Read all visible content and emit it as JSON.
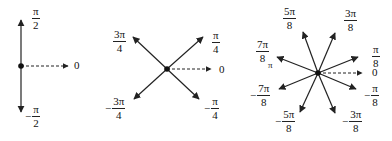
{
  "diagrams": [
    {
      "id": "two-directions",
      "center": [
        21,
        66
      ],
      "labels": {
        "up": {
          "sign": "",
          "num": "π",
          "den": "2"
        },
        "zero": "0",
        "down": {
          "sign": "−",
          "num": "π",
          "den": "2"
        }
      }
    },
    {
      "id": "four-directions",
      "center": [
        167,
        69
      ],
      "labels": {
        "ne": {
          "sign": "",
          "num": "π",
          "den": "4"
        },
        "nw": {
          "sign": "",
          "num": "3π",
          "den": "4"
        },
        "zero": "0",
        "sw": {
          "sign": "−",
          "num": "3π",
          "den": "4"
        },
        "se": {
          "sign": "−",
          "num": "π",
          "den": "4"
        }
      }
    },
    {
      "id": "eight-directions",
      "center": [
        318,
        73
      ],
      "labels": {
        "d1": {
          "sign": "",
          "num": "π",
          "den": "8"
        },
        "d3": {
          "sign": "",
          "num": "3π",
          "den": "8"
        },
        "d5": {
          "sign": "",
          "num": "5π",
          "den": "8"
        },
        "d7": {
          "sign": "",
          "num": "7π",
          "den": "8"
        },
        "pi": "π",
        "zero": "0",
        "m1": {
          "sign": "−",
          "num": "π",
          "den": "8"
        },
        "m3": {
          "sign": "−",
          "num": "3π",
          "den": "8"
        },
        "m5": {
          "sign": "−",
          "num": "5π",
          "den": "8"
        },
        "m7": {
          "sign": "−",
          "num": "7π",
          "den": "8"
        }
      }
    }
  ],
  "colors": {
    "stroke": "#222222",
    "background": "#ffffff"
  }
}
